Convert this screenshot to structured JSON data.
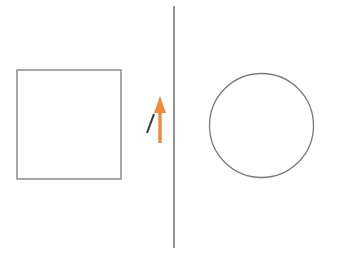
{
  "canvas": {
    "width": 341,
    "height": 254,
    "background_color": "#ffffff",
    "title": "shape-comparison-diagram"
  },
  "palette": {
    "stroke_gray": "#7a7a7a",
    "stroke_dark": "#3d3d45",
    "accent_orange": "#ed8a3c",
    "background": "#ffffff"
  },
  "shapes": {
    "square": {
      "name": "square",
      "x": 17,
      "y": 70,
      "width": 104,
      "height": 109,
      "stroke_color": "#7a7a7a",
      "stroke_width": 1.3,
      "fill": "none"
    },
    "divider_line": {
      "name": "vertical-divider-line",
      "x1": 174,
      "y1": 6,
      "x2": 174,
      "y2": 248,
      "stroke_color": "#7a7a7a",
      "stroke_width": 1.6
    },
    "arrow": {
      "name": "up-arrow",
      "direction": "up",
      "x": 160,
      "tip_y": 96,
      "tail_y": 143,
      "shaft_width": 3.4,
      "head_width": 12,
      "head_height": 17,
      "color": "#ed8a3c"
    },
    "tick_mark": {
      "name": "diagonal-tick-mark",
      "x1": 147,
      "y1": 133,
      "x2": 154,
      "y2": 114,
      "stroke_color": "#3d3d45",
      "stroke_width": 2.1
    },
    "circle": {
      "name": "circle",
      "cx": 261.5,
      "cy": 125.5,
      "r": 52,
      "stroke_color": "#7a7a7a",
      "stroke_width": 1.3,
      "fill": "none"
    }
  }
}
